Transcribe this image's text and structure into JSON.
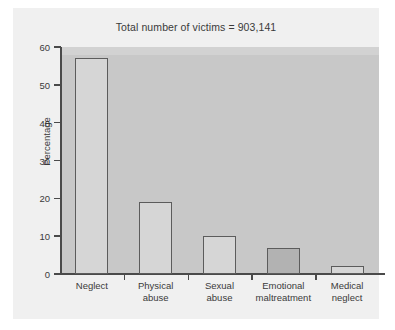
{
  "chart_data": {
    "type": "bar",
    "title": "Total number of victims = 903,141",
    "xlabel": "",
    "ylabel": "Percentage",
    "ylim": [
      0,
      60
    ],
    "yticks": [
      "0",
      "10",
      "20",
      "30",
      "40",
      "50",
      "60"
    ],
    "grid": false,
    "legend": null,
    "categories": [
      "Neglect",
      "Physical abuse",
      "Sexual abuse",
      "Emotional maltreatment",
      "Medical neglect"
    ],
    "category_lines": [
      [
        "Neglect"
      ],
      [
        "Physical",
        "abuse"
      ],
      [
        "Sexual",
        "abuse"
      ],
      [
        "Emotional",
        "maltreatment"
      ],
      [
        "Medical",
        "neglect"
      ]
    ],
    "values": [
      57,
      19,
      10,
      7,
      2
    ],
    "bar_fills": [
      "#d6d6d6",
      "#d6d6d6",
      "#d6d6d6",
      "#b2b2b2",
      "#d6d6d6"
    ],
    "bar_edge_color": "#5c5c5c",
    "plot_background": "#c8c8c8",
    "figure_background": "#f0f0f0",
    "axis_color": "#4a4a4a",
    "text_color": "#3a3a3a"
  }
}
